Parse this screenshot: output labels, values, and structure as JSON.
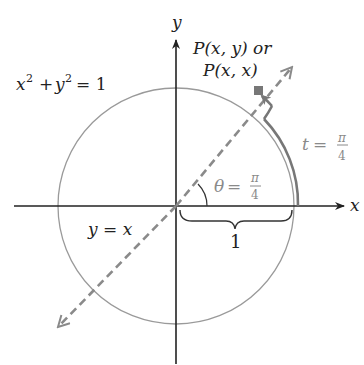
{
  "figure": {
    "type": "unit-circle-diagram",
    "axes": {
      "x_label": "x",
      "y_label": "y"
    },
    "circle": {
      "equation_lhs_x": "x",
      "equation_exp": "2",
      "equation_plus": "+",
      "equation_lhs_y": "y",
      "equation_rhs": "= 1",
      "center": [
        0,
        0
      ],
      "radius": 1
    },
    "line": {
      "label": "y = x",
      "style": "dashed"
    },
    "point": {
      "label_line1": "P(x, y) or",
      "label_line2": "P(x, x)"
    },
    "arc_length": {
      "var": "t",
      "eq": "=",
      "numerator": "π",
      "denominator": "4"
    },
    "angle": {
      "var": "θ",
      "eq": "=",
      "numerator": "π",
      "denominator": "4"
    },
    "radius_brace": {
      "label": "1"
    },
    "colors": {
      "axis": "#222222",
      "circle": "#999999",
      "dashed_line": "#8a8a8a",
      "arc": "#777777",
      "point": "#777777",
      "label_light": "#8a8a8a"
    }
  }
}
